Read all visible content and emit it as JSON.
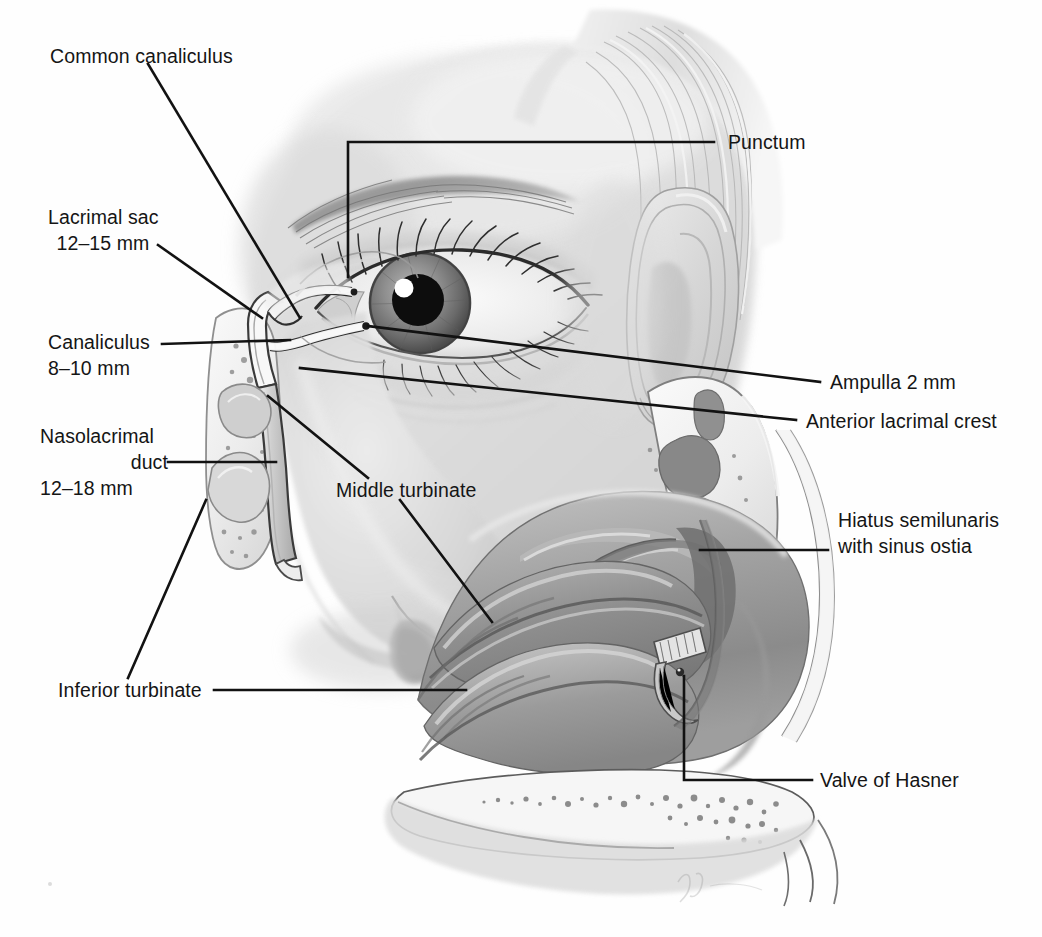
{
  "figure": {
    "background_color": "#fefefe",
    "ink_color": "#151515",
    "width": 1042,
    "height": 937
  },
  "labels": {
    "common_canaliculus": "Common canaliculus",
    "lacrimal_sac_name": "Lacrimal sac",
    "lacrimal_sac_size": "12–15 mm",
    "canaliculus_name": "Canaliculus",
    "canaliculus_size": "8–10 mm",
    "nasolacrimal_duct_line1": "Nasolacrimal",
    "nasolacrimal_duct_line2": "duct",
    "nasolacrimal_duct_size": "12–18 mm",
    "inferior_turbinate": "Inferior turbinate",
    "middle_turbinate": "Middle turbinate",
    "punctum": "Punctum",
    "ampulla": "Ampulla 2 mm",
    "anterior_lacrimal_crest": "Anterior lacrimal crest",
    "hiatus_line1": "Hiatus semilunaris",
    "hiatus_line2": "with sinus ostia",
    "valve_of_hasner": "Valve of Hasner"
  },
  "anatomy_structures": [
    "face in three-quarter profile",
    "eyebrow",
    "eye with iris, pupil and corneal highlight",
    "upper and lower eyelashes",
    "ear auricle",
    "nose external profile",
    "cut-away lacrimal sac and nasolacrimal duct",
    "superior and inferior canaliculi",
    "lateral nasal wall with superior, middle and inferior turbinates",
    "maxillary bone cross-section with cancellous cells",
    "hard palate and upper lip",
    "artist signature"
  ]
}
